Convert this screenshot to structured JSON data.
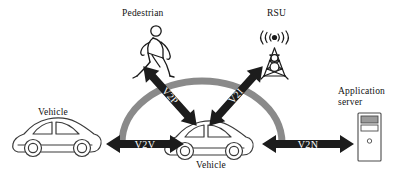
{
  "diagram": {
    "background": "#ffffff",
    "palette": {
      "arrow_fill": "#1c1c1c",
      "arc_stroke": "#8a8a8a",
      "outline": "#3a3a3a",
      "text": "#111111",
      "server_bar": "#9a9a9a"
    },
    "nodes": [
      {
        "id": "pedestrian",
        "label": "Pedestrian",
        "icon": "pedestrian-icon",
        "label_x": 122,
        "label_y": 8
      },
      {
        "id": "rsu",
        "label": "RSU",
        "icon": "rsu-tower-icon",
        "label_x": 267,
        "label_y": 8
      },
      {
        "id": "vehicle-left",
        "label": "Vehicle",
        "icon": "car-icon",
        "label_x": 38,
        "label_y": 107
      },
      {
        "id": "vehicle-center",
        "label": "Vehicle",
        "icon": "car-icon",
        "label_x": 196,
        "label_y": 160
      },
      {
        "id": "application-server",
        "label_line1": "Application",
        "label_line2": "server",
        "icon": "server-tower-icon",
        "label_x": 338,
        "label_y": 86
      }
    ],
    "links": [
      {
        "id": "v2p",
        "label": "V2P",
        "from": "vehicle-center",
        "to": "pedestrian",
        "style": "double-headed-arrow",
        "orientation": "diagonal-up-left"
      },
      {
        "id": "v2i",
        "label": "V2I",
        "from": "vehicle-center",
        "to": "rsu",
        "style": "double-headed-arrow",
        "orientation": "diagonal-up-right"
      },
      {
        "id": "v2v",
        "label": "V2V",
        "from": "vehicle-center",
        "to": "vehicle-left",
        "style": "double-headed-arrow",
        "orientation": "horizontal"
      },
      {
        "id": "v2n",
        "label": "V2N",
        "from": "vehicle-center",
        "to": "application-server",
        "style": "double-headed-arrow",
        "orientation": "horizontal"
      }
    ],
    "arc": {
      "id": "coverage-arc",
      "description": "gray semicircular arc connecting left and right sides over the center vehicle"
    }
  }
}
